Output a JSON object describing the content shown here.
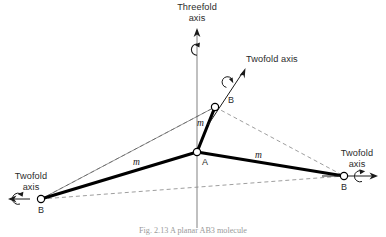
{
  "figure": {
    "caption": "Fig. 2.13   A planar AB3 molecule",
    "axes": {
      "threefold": {
        "label_line1": "Threefold",
        "label_line2": "axis",
        "name": "threefold-axis"
      },
      "twofold_upper_right": {
        "label_line1": "Twofold axis",
        "label_line2": "",
        "name": "twofold-axis-upper-right"
      },
      "twofold_right": {
        "label_line1": "Twofold",
        "label_line2": "axis",
        "name": "twofold-axis-right"
      },
      "twofold_left": {
        "label_line1": "Twofold",
        "label_line2": "axis",
        "name": "twofold-axis-left"
      }
    },
    "atoms": {
      "center": {
        "label": "A",
        "x": 197,
        "y": 152
      },
      "upper": {
        "label": "B",
        "x": 215,
        "y": 107
      },
      "left": {
        "label": "B",
        "x": 41,
        "y": 199
      },
      "right": {
        "label": "B",
        "x": 344,
        "y": 176
      }
    },
    "bonds": [
      {
        "label": "m",
        "from": "center",
        "to": "upper"
      },
      {
        "label": "m",
        "from": "center",
        "to": "left"
      },
      {
        "label": "m",
        "from": "center",
        "to": "right"
      }
    ],
    "colors": {
      "bond": "#000000",
      "dashed": "#8c8c8c",
      "axis": "#8c8c8c",
      "text": "#2b2b2b",
      "atom_fill": "#ffffff",
      "caption": "#9a9a9a"
    }
  }
}
